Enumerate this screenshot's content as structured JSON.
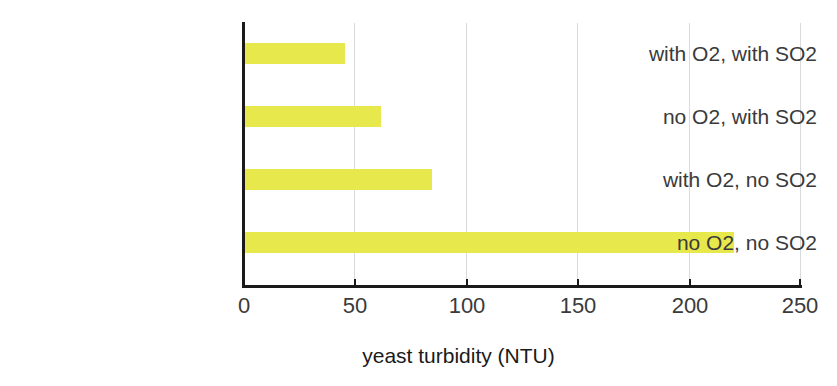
{
  "chart_data": {
    "type": "bar",
    "orientation": "horizontal",
    "title": "",
    "xlabel": "yeast turbidity (NTU)",
    "ylabel": "",
    "categories": [
      "with O2, with SO2",
      "no O2, with SO2",
      "with O2, no SO2",
      "no O2, no SO2"
    ],
    "values": [
      46,
      62,
      85,
      220
    ],
    "xlim": [
      0,
      250
    ],
    "xticks": [
      0,
      50,
      100,
      150,
      200,
      250
    ],
    "xtick_labels": [
      "0",
      "50",
      "100",
      "150",
      "200",
      "250"
    ],
    "grid": "vertical",
    "legend": "none",
    "bar_color": "#e7e84c",
    "axis_color": "#1a1a1a",
    "gridline_color": "#d9dadb",
    "text_color": "#3a3a3a"
  }
}
